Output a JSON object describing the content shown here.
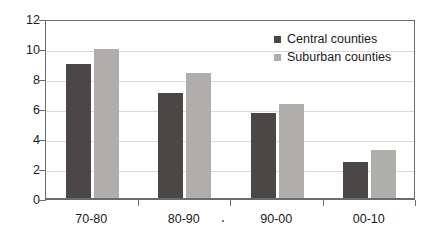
{
  "chart_data": {
    "type": "bar",
    "title": "",
    "subtitle": "",
    "xlabel": "",
    "ylabel": "",
    "categories": [
      "70-80",
      "80-90",
      "90-00",
      "00-10"
    ],
    "series": [
      {
        "name": "Central counties",
        "color": "#4a4746",
        "values": [
          9.0,
          7.05,
          5.75,
          2.5
        ]
      },
      {
        "name": "Suburban counties",
        "color": "#b0aeab",
        "values": [
          10.0,
          8.4,
          6.35,
          3.25
        ]
      }
    ],
    "ylim": [
      0,
      12
    ],
    "ytick_values": [
      0,
      2,
      4,
      6,
      8,
      10,
      12
    ],
    "ytick_labels": [
      "0",
      "2",
      "4",
      "6",
      "8",
      "10",
      "12"
    ],
    "grid": true,
    "grid_axis": "y",
    "legend_position": "top-right",
    "annotations": []
  },
  "legend": {
    "entries": [
      {
        "label": "Central counties",
        "color": "#4a4746"
      },
      {
        "label": "Suburban counties",
        "color": "#b0aeab"
      }
    ]
  },
  "colors": {
    "central": "#4a4746",
    "suburban": "#b0aeab",
    "axis": "#6b6b6b",
    "grid": "#d9d9d9",
    "text": "#1a1a1a",
    "background": "#ffffff"
  }
}
